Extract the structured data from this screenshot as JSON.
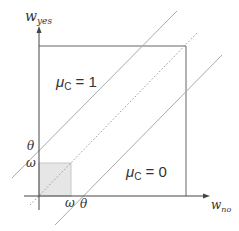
{
  "diagram": {
    "axes": {
      "x_label": "w",
      "x_sub": "no",
      "y_label": "w",
      "y_sub": "yes"
    },
    "regions": [
      {
        "label_main": "μ",
        "label_sub": "C",
        "label_rest": " = 1"
      },
      {
        "label_main": "μ",
        "label_sub": "C",
        "label_rest": " = 0"
      }
    ],
    "ticks": {
      "y_theta": "θ",
      "y_omega": "ω",
      "x_omega": "ω",
      "x_theta": "θ",
      "x_sep": "/"
    },
    "colors": {
      "axis": "#333333",
      "box": "#555555",
      "lines": "#aaaaaa",
      "shade": "#e6e6e6"
    }
  }
}
